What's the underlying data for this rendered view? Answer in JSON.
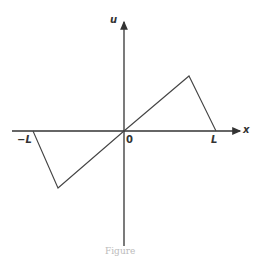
{
  "diagram": {
    "axes": {
      "x_label": "x",
      "y_label": "u",
      "origin_label": "0",
      "neg_label": "−L",
      "pos_label": "L"
    },
    "curve": {
      "description": "odd periodic extension sawtooth: zero at -L, min near -0.73L, through origin, max near 0.7L, zero at L",
      "points": [
        [
          -1.0,
          0
        ],
        [
          -0.73,
          -1
        ],
        [
          0,
          0
        ],
        [
          0.71,
          1
        ],
        [
          1.0,
          0
        ]
      ]
    },
    "caption_partial": "Figure",
    "colors": {
      "line": "#444444",
      "axis": "#333333"
    }
  }
}
